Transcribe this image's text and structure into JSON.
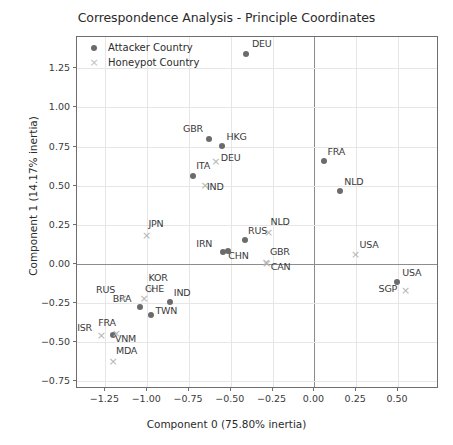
{
  "chart_data": {
    "type": "scatter",
    "title": "Correspondence Analysis - Principle Coordinates",
    "xlabel": "Component 0 (75.80% inertia)",
    "ylabel": "Component 1 (14.17% inertia)",
    "xlim": [
      -1.42,
      0.745
    ],
    "ylim": [
      -0.8,
      1.45
    ],
    "xticks": [
      "-1.25",
      "-1.00",
      "-0.75",
      "-0.50",
      "-0.25",
      "0.00",
      "0.25",
      "0.50"
    ],
    "xtick_values": [
      -1.25,
      -1.0,
      -0.75,
      -0.5,
      -0.25,
      0.0,
      0.25,
      0.5
    ],
    "yticks": [
      "1.25",
      "1.00",
      "0.75",
      "0.50",
      "0.25",
      "0.00",
      "-0.25",
      "-0.50",
      "-0.75"
    ],
    "ytick_values": [
      1.25,
      1.0,
      0.75,
      0.5,
      0.25,
      0.0,
      -0.25,
      -0.5,
      -0.75
    ],
    "grid": true,
    "legend_position": "upper left",
    "series": [
      {
        "name": "Attacker Country",
        "marker": "dot",
        "color": "#6b6b6b",
        "points": [
          {
            "label": "DEU",
            "x": -0.41,
            "y": 1.34,
            "lx": 6,
            "ly": -11
          },
          {
            "label": "GBR",
            "x": -0.63,
            "y": 0.8,
            "lx": -26,
            "ly": -11
          },
          {
            "label": "HKG",
            "x": -0.555,
            "y": 0.755,
            "lx": 5,
            "ly": -10
          },
          {
            "label": "ITA",
            "x": -0.725,
            "y": 0.565,
            "lx": 3,
            "ly": -11
          },
          {
            "label": "FRA",
            "x": 0.055,
            "y": 0.655,
            "lx": 4,
            "ly": -10
          },
          {
            "label": "NLD",
            "x": 0.155,
            "y": 0.465,
            "lx": 4,
            "ly": -10
          },
          {
            "label": "RUS",
            "x": -0.415,
            "y": 0.155,
            "lx": 3,
            "ly": -10
          },
          {
            "label": "CHN",
            "x": -0.515,
            "y": 0.08,
            "lx": 0,
            "ly": 4
          },
          {
            "label": "IRN",
            "x": -0.545,
            "y": 0.075,
            "lx": -27,
            "ly": -9
          },
          {
            "label": "BRA",
            "x": -1.045,
            "y": -0.275,
            "lx": -27,
            "ly": -9
          },
          {
            "label": "TWN",
            "x": -0.975,
            "y": -0.325,
            "lx": 4,
            "ly": -5
          },
          {
            "label": "IND",
            "x": -0.865,
            "y": -0.245,
            "lx": 4,
            "ly": -10
          },
          {
            "label": "VNM",
            "x": -1.205,
            "y": -0.455,
            "lx": 2,
            "ly": 3
          },
          {
            "label": "USA",
            "x": 0.495,
            "y": -0.115,
            "lx": 5,
            "ly": -10
          },
          {
            "label": "USA_label_dup",
            "x": null,
            "y": null,
            "lx": 0,
            "ly": 0
          }
        ]
      },
      {
        "name": "Honeypot Country",
        "marker": "cross",
        "color": "#b4b4b4",
        "points": [
          {
            "label": "DEU",
            "x": -0.59,
            "y": 0.655,
            "lx": 5,
            "ly": -4
          },
          {
            "label": "IND",
            "x": -0.655,
            "y": 0.505,
            "lx": 2,
            "ly": 1
          },
          {
            "label": "NLD",
            "x": -0.275,
            "y": 0.205,
            "lx": 2,
            "ly": -11
          },
          {
            "label": "JPN",
            "x": -1.005,
            "y": 0.185,
            "lx": 2,
            "ly": -12
          },
          {
            "label": "GBR",
            "x": -0.29,
            "y": 0.015,
            "lx": 4,
            "ly": -11
          },
          {
            "label": "CAN",
            "x": -0.285,
            "y": 0.005,
            "lx": 4,
            "ly": 3
          },
          {
            "label": "KOR",
            "x": -0.975,
            "y": -0.16,
            "lx": -3,
            "ly": -12
          },
          {
            "label": "CHE",
            "x": -1.02,
            "y": -0.215,
            "lx": 1,
            "ly": -10
          },
          {
            "label": "RUS",
            "x": -1.145,
            "y": -0.215,
            "lx": -27,
            "ly": -9
          },
          {
            "label": "ISR",
            "x": -1.275,
            "y": -0.455,
            "lx": -24,
            "ly": -8
          },
          {
            "label": "FRA",
            "x": -1.185,
            "y": -0.44,
            "lx": -18,
            "ly": -11
          },
          {
            "label": "MDA",
            "x": -1.205,
            "y": -0.62,
            "lx": 3,
            "ly": -11
          },
          {
            "label": "USA",
            "x": 0.245,
            "y": 0.065,
            "lx": 4,
            "ly": -10
          },
          {
            "label": "SGP",
            "x": 0.545,
            "y": -0.165,
            "lx": -27,
            "ly": -2
          }
        ]
      }
    ]
  },
  "legend": {
    "items": [
      {
        "label": "Attacker Country",
        "marker": "dot"
      },
      {
        "label": "Honeypot Country",
        "marker": "cross"
      }
    ]
  }
}
